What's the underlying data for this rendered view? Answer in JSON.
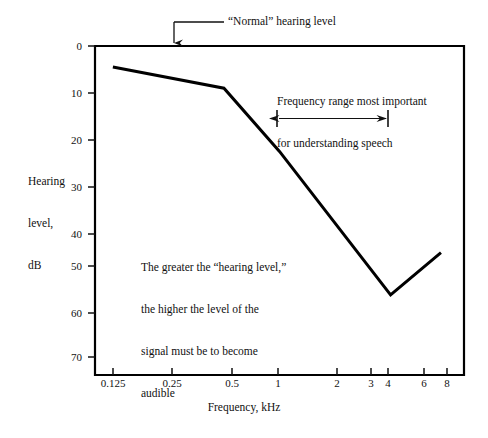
{
  "chart_data": {
    "type": "line",
    "title": "",
    "xlabel": "Frequency, kHz",
    "ylabel": "Hearing level, dB",
    "ylabel_lines": [
      "Hearing",
      "level,",
      "dB"
    ],
    "x_scale": "log",
    "x_tick_values": [
      0.125,
      0.25,
      0.5,
      1,
      2,
      3,
      4,
      6,
      8
    ],
    "x_tick_labels": [
      "0.125",
      "0.25",
      "0.5",
      "1",
      "2",
      "3",
      "4",
      "6",
      "8"
    ],
    "xlim": [
      0.1,
      10
    ],
    "y_tick_values": [
      0,
      10,
      20,
      30,
      40,
      50,
      60,
      70
    ],
    "y_tick_labels": [
      "0",
      "10",
      "20",
      "30",
      "40",
      "50",
      "60",
      "70"
    ],
    "ylim": [
      0,
      78
    ],
    "y_axis_inverted": true,
    "grid": false,
    "legend": "none",
    "series": [
      {
        "name": "Hearing level",
        "x": [
          0.125,
          0.5,
          1.0,
          4.0,
          7.5
        ],
        "values": [
          5,
          10,
          25,
          59,
          49
        ]
      }
    ],
    "annotations": [
      {
        "name": "normal-hearing-level",
        "text": "“Normal” hearing level",
        "points_to_y": 0
      },
      {
        "name": "speech-frequency-range",
        "text": "Frequency range most important\nfor understanding speech",
        "range_x": [
          1,
          4
        ],
        "marker_y": 16
      },
      {
        "name": "hearing-level-explanation",
        "text": "The greater the “hearing level,”\nthe higher the level of the\nsignal must be to become\naudible"
      }
    ]
  },
  "annotations": {
    "normal": "“Normal” hearing level",
    "speech_line1": "Frequency range most important",
    "speech_line2": "for understanding speech",
    "greater_line1": "The greater the “hearing level,”",
    "greater_line2": "the higher the level of the",
    "greater_line3": "signal must be to become",
    "greater_line4": "audible"
  },
  "axes": {
    "y_title_line1": "Hearing",
    "y_title_line2": "level,",
    "y_title_line3": "dB",
    "x_title": "Frequency, kHz"
  },
  "colors": {
    "line": "#000000",
    "axis": "#000000",
    "background": "#ffffff",
    "text": "#111111"
  }
}
